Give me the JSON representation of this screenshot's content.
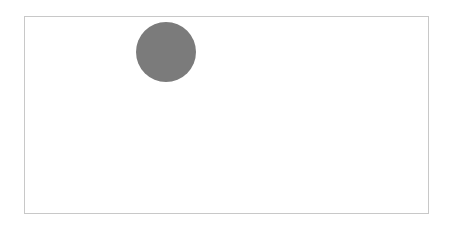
{
  "canvas": {
    "border_color": "#c8c8c8",
    "background": "#ffffff"
  },
  "shapes": [
    {
      "type": "circle",
      "cx": 166,
      "cy": 52,
      "r": 30,
      "fill": "#7b7b7b"
    }
  ]
}
